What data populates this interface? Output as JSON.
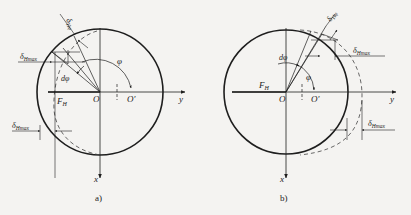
{
  "figure": {
    "panels": [
      {
        "id": "a",
        "caption": "a)",
        "labels": {
          "delta_phi": "δ",
          "delta_phi_sub": "Hφ",
          "delta_max": "δ",
          "delta_max_sub": "Hmax",
          "delta_max_lower": "δ",
          "delta_max_lower_sub": "Hmax",
          "dphi": "dφ",
          "phi": "φ",
          "force": "F",
          "force_sub": "H",
          "origin": "O",
          "origin_shifted": "O′",
          "x_axis": "x",
          "y_axis": "y"
        }
      },
      {
        "id": "b",
        "caption": "b)",
        "labels": {
          "delta_phi": "δ",
          "delta_phi_sub": "Hφ",
          "delta_max": "δ",
          "delta_max_sub": "Hmax",
          "delta_max_lower": "δ",
          "delta_max_lower_sub": "Hmax",
          "dphi": "dφ",
          "phi": "φ",
          "force": "F",
          "force_sub": "H",
          "origin": "O",
          "origin_shifted": "O′",
          "x_axis": "x",
          "y_axis": "y"
        }
      }
    ],
    "colors": {
      "stroke": "#1e1e1e",
      "background": "#f4f3f1"
    }
  }
}
